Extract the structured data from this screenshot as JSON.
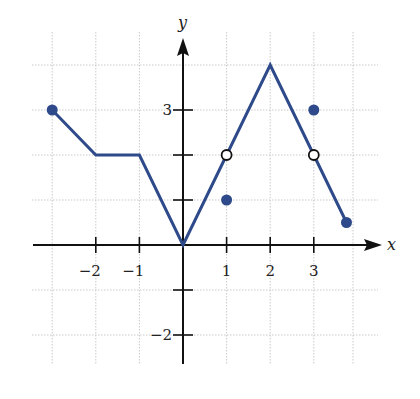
{
  "chart_data": {
    "type": "line",
    "title": "",
    "xlabel": "x",
    "ylabel": "y",
    "xlim": [
      -3.35,
      4.4
    ],
    "ylim": [
      -2.6,
      4.75
    ],
    "grid": true,
    "x_ticks": [
      {
        "value": -2,
        "label": "−2"
      },
      {
        "value": -1,
        "label": "−1"
      },
      {
        "value": 1,
        "label": "1"
      },
      {
        "value": 2,
        "label": "2"
      },
      {
        "value": 3,
        "label": "3"
      }
    ],
    "y_ticks": [
      {
        "value": 3,
        "label": "3"
      },
      {
        "value": 2,
        "label": ""
      },
      {
        "value": 1,
        "label": ""
      },
      {
        "value": -1,
        "label": ""
      },
      {
        "value": -2,
        "label": "−2"
      }
    ],
    "series": [
      {
        "name": "f(x)",
        "points": [
          [
            -3,
            3
          ],
          [
            -2,
            2
          ],
          [
            -1,
            2
          ],
          [
            0,
            0
          ],
          [
            1,
            2
          ],
          [
            2,
            4
          ],
          [
            3,
            2
          ],
          [
            3.75,
            0.5
          ]
        ]
      }
    ],
    "filled_points": [
      [
        -3,
        3
      ],
      [
        1,
        1
      ],
      [
        3,
        3
      ],
      [
        3.75,
        0.5
      ]
    ],
    "open_points": [
      [
        1,
        2
      ],
      [
        3,
        2
      ]
    ],
    "colors": {
      "curve": "#2e4a8a",
      "filled_dot": "#2e4a8a",
      "open_dot_stroke": "#111111",
      "axis": "#111111",
      "grid": "#c9c9c9"
    }
  }
}
